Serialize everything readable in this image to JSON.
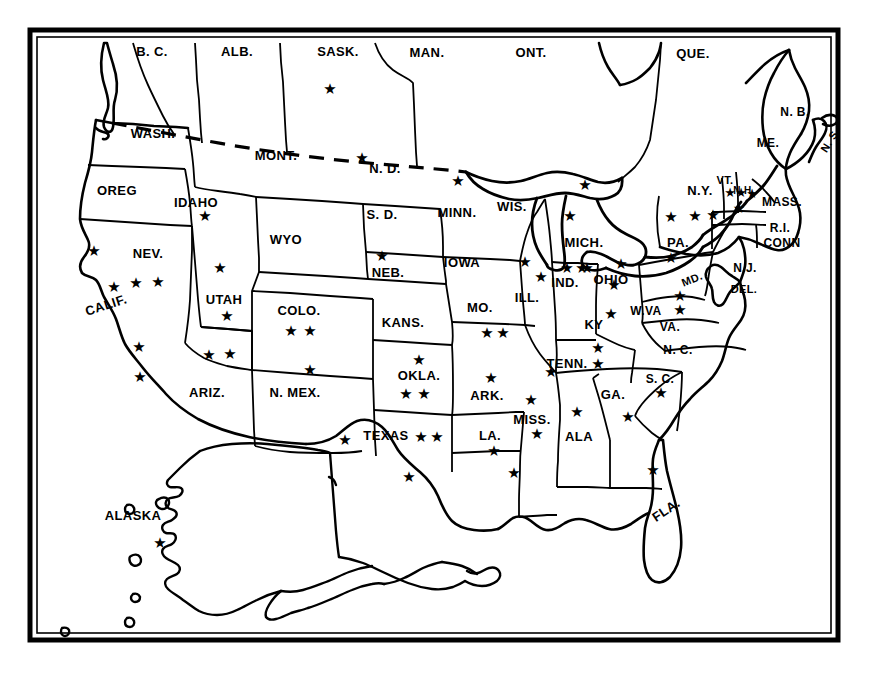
{
  "map": {
    "title": "North America States and Provinces Star Distribution Map",
    "style": {
      "ink_color": "#000000",
      "paper_color": "#ffffff",
      "frame_color": "#000000",
      "star_glyph": "★"
    },
    "frame": {
      "x": 30,
      "y": 30,
      "width": 808,
      "height": 610
    },
    "labels": [
      {
        "name": "label-bc",
        "text": "B. C.",
        "x": 152,
        "y": 51,
        "size": 13
      },
      {
        "name": "label-alb",
        "text": "ALB.",
        "x": 237,
        "y": 51,
        "size": 13
      },
      {
        "name": "label-sask",
        "text": "SASK.",
        "x": 338,
        "y": 51,
        "size": 13
      },
      {
        "name": "label-man",
        "text": "MAN.",
        "x": 427,
        "y": 52,
        "size": 13
      },
      {
        "name": "label-ont",
        "text": "ONT.",
        "x": 531,
        "y": 52,
        "size": 13
      },
      {
        "name": "label-que",
        "text": "QUE.",
        "x": 693,
        "y": 53,
        "size": 13
      },
      {
        "name": "label-nb",
        "text": "N. B.",
        "x": 795,
        "y": 112,
        "size": 12
      },
      {
        "name": "label-ns",
        "text": "N. S.",
        "x": 830,
        "y": 140,
        "size": 11,
        "rotate": -58
      },
      {
        "name": "label-me",
        "text": "ME.",
        "x": 768,
        "y": 143,
        "size": 12
      },
      {
        "name": "label-wash",
        "text": "WASH.",
        "x": 153,
        "y": 133,
        "size": 13
      },
      {
        "name": "label-mont",
        "text": "MONT.",
        "x": 276,
        "y": 155,
        "size": 13
      },
      {
        "name": "label-nd",
        "text": "N. D.",
        "x": 385,
        "y": 168,
        "size": 13
      },
      {
        "name": "label-oreg",
        "text": "OREG",
        "x": 117,
        "y": 190,
        "size": 13
      },
      {
        "name": "label-idaho",
        "text": "IDAHO",
        "x": 196,
        "y": 202,
        "size": 13
      },
      {
        "name": "label-sd",
        "text": "S. D.",
        "x": 382,
        "y": 214,
        "size": 13
      },
      {
        "name": "label-minn",
        "text": "MINN.",
        "x": 457,
        "y": 212,
        "size": 13
      },
      {
        "name": "label-wis",
        "text": "WIS.",
        "x": 512,
        "y": 206,
        "size": 13
      },
      {
        "name": "label-ny",
        "text": "N.Y.",
        "x": 700,
        "y": 190,
        "size": 13
      },
      {
        "name": "label-vt",
        "text": "VT.",
        "x": 725,
        "y": 180,
        "size": 11
      },
      {
        "name": "label-nh",
        "text": "N.H.",
        "x": 744,
        "y": 190,
        "size": 10
      },
      {
        "name": "label-mass",
        "text": "MASS.",
        "x": 782,
        "y": 202,
        "size": 12
      },
      {
        "name": "label-wyo",
        "text": "WYO",
        "x": 286,
        "y": 239,
        "size": 13
      },
      {
        "name": "label-mich",
        "text": "MICH.",
        "x": 584,
        "y": 242,
        "size": 13
      },
      {
        "name": "label-pa",
        "text": "PA.",
        "x": 678,
        "y": 242,
        "size": 13
      },
      {
        "name": "label-ri",
        "text": "R.I.",
        "x": 780,
        "y": 228,
        "size": 12
      },
      {
        "name": "label-conn",
        "text": "CONN",
        "x": 782,
        "y": 243,
        "size": 12
      },
      {
        "name": "label-nev",
        "text": "NEV.",
        "x": 148,
        "y": 253,
        "size": 13
      },
      {
        "name": "label-neb",
        "text": "NEB.",
        "x": 388,
        "y": 272,
        "size": 13
      },
      {
        "name": "label-iowa",
        "text": "IOWA",
        "x": 462,
        "y": 262,
        "size": 13
      },
      {
        "name": "label-ind",
        "text": "IND.",
        "x": 565,
        "y": 282,
        "size": 13
      },
      {
        "name": "label-ohio",
        "text": "OHIO",
        "x": 611,
        "y": 279,
        "size": 13
      },
      {
        "name": "label-nj",
        "text": "N.J.",
        "x": 745,
        "y": 268,
        "size": 12
      },
      {
        "name": "label-md",
        "text": "MD.",
        "x": 692,
        "y": 279,
        "size": 11,
        "rotate": -22
      },
      {
        "name": "label-del",
        "text": "DEL.",
        "x": 744,
        "y": 289,
        "size": 11
      },
      {
        "name": "label-calif",
        "text": "CALIF.",
        "x": 106,
        "y": 305,
        "size": 13,
        "rotate": -18
      },
      {
        "name": "label-utah",
        "text": "UTAH",
        "x": 224,
        "y": 299,
        "size": 13
      },
      {
        "name": "label-colo",
        "text": "COLO.",
        "x": 299,
        "y": 310,
        "size": 13
      },
      {
        "name": "label-ill",
        "text": "ILL.",
        "x": 527,
        "y": 297,
        "size": 13
      },
      {
        "name": "label-mo",
        "text": "MO.",
        "x": 480,
        "y": 307,
        "size": 13
      },
      {
        "name": "label-kans",
        "text": "KANS.",
        "x": 403,
        "y": 322,
        "size": 13
      },
      {
        "name": "label-ky",
        "text": "KY",
        "x": 594,
        "y": 324,
        "size": 13
      },
      {
        "name": "label-wva",
        "text": "W.VA",
        "x": 646,
        "y": 311,
        "size": 12
      },
      {
        "name": "label-va",
        "text": "VA.",
        "x": 670,
        "y": 327,
        "size": 12
      },
      {
        "name": "label-nc",
        "text": "N. C.",
        "x": 678,
        "y": 350,
        "size": 12
      },
      {
        "name": "label-ariz",
        "text": "ARIZ.",
        "x": 207,
        "y": 392,
        "size": 13
      },
      {
        "name": "label-nmex",
        "text": "N. MEX.",
        "x": 295,
        "y": 392,
        "size": 13
      },
      {
        "name": "label-okla",
        "text": "OKLA.",
        "x": 419,
        "y": 375,
        "size": 13
      },
      {
        "name": "label-ark",
        "text": "ARK.",
        "x": 487,
        "y": 395,
        "size": 13
      },
      {
        "name": "label-tenn",
        "text": "TENN.",
        "x": 567,
        "y": 363,
        "size": 13
      },
      {
        "name": "label-ga",
        "text": "GA.",
        "x": 613,
        "y": 394,
        "size": 13
      },
      {
        "name": "label-sc",
        "text": "S. C.",
        "x": 660,
        "y": 379,
        "size": 12
      },
      {
        "name": "label-texas",
        "text": "TEXAS",
        "x": 386,
        "y": 435,
        "size": 13
      },
      {
        "name": "label-la",
        "text": "LA.",
        "x": 490,
        "y": 435,
        "size": 13
      },
      {
        "name": "label-miss",
        "text": "MISS.",
        "x": 532,
        "y": 419,
        "size": 13
      },
      {
        "name": "label-ala",
        "text": "ALA",
        "x": 579,
        "y": 436,
        "size": 13
      },
      {
        "name": "label-fla",
        "text": "FLA.",
        "x": 666,
        "y": 510,
        "size": 13,
        "rotate": -34
      },
      {
        "name": "label-alaska",
        "text": "ALASKA",
        "x": 133,
        "y": 515,
        "size": 13
      }
    ],
    "stars": [
      {
        "name": "star-sask",
        "region": "SASK.",
        "x": 330,
        "y": 89,
        "size": 15
      },
      {
        "name": "star-nd",
        "region": "N. D.",
        "x": 362,
        "y": 158,
        "size": 15
      },
      {
        "name": "star-minn",
        "region": "MINN.",
        "x": 458,
        "y": 181,
        "size": 15
      },
      {
        "name": "star-idaho",
        "region": "IDAHO",
        "x": 205,
        "y": 216,
        "size": 15
      },
      {
        "name": "star-upper-mich",
        "region": "MICH.",
        "x": 585,
        "y": 185,
        "size": 15
      },
      {
        "name": "star-ny-1",
        "region": "N.Y.",
        "x": 671,
        "y": 217,
        "size": 15
      },
      {
        "name": "star-ny-2",
        "region": "N.Y.",
        "x": 695,
        "y": 216,
        "size": 15
      },
      {
        "name": "star-ny-3",
        "region": "N.Y.",
        "x": 713,
        "y": 215,
        "size": 15
      },
      {
        "name": "star-vt",
        "region": "VT.",
        "x": 730,
        "y": 192,
        "size": 13
      },
      {
        "name": "star-nh",
        "region": "N.H.",
        "x": 741,
        "y": 192,
        "size": 13
      },
      {
        "name": "star-me",
        "region": "ME.",
        "x": 752,
        "y": 193,
        "size": 13
      },
      {
        "name": "star-mass",
        "region": "MASS.",
        "x": 739,
        "y": 208,
        "size": 14
      },
      {
        "name": "star-calif-1",
        "region": "CALIF.",
        "x": 94,
        "y": 251,
        "size": 15
      },
      {
        "name": "star-nev-1",
        "region": "NEV.",
        "x": 136,
        "y": 283,
        "size": 15
      },
      {
        "name": "star-nev-2",
        "region": "NEV.",
        "x": 158,
        "y": 282,
        "size": 15
      },
      {
        "name": "star-calif-2",
        "region": "CALIF.",
        "x": 114,
        "y": 287,
        "size": 15
      },
      {
        "name": "star-utah-1",
        "region": "UTAH",
        "x": 220,
        "y": 268,
        "size": 15
      },
      {
        "name": "star-utah-2",
        "region": "UTAH",
        "x": 227,
        "y": 316,
        "size": 15
      },
      {
        "name": "star-neb",
        "region": "NEB.",
        "x": 382,
        "y": 256,
        "size": 15
      },
      {
        "name": "star-mich-2",
        "region": "MICH.",
        "x": 570,
        "y": 216,
        "size": 15
      },
      {
        "name": "star-pa-1",
        "region": "PA.",
        "x": 671,
        "y": 258,
        "size": 15
      },
      {
        "name": "star-ind-1",
        "region": "IND.",
        "x": 567,
        "y": 268,
        "size": 15
      },
      {
        "name": "star-ind-2",
        "region": "IND.",
        "x": 582,
        "y": 268,
        "size": 15
      },
      {
        "name": "star-ohio-1",
        "region": "OHIO",
        "x": 621,
        "y": 264,
        "size": 15
      },
      {
        "name": "star-ohio-2",
        "region": "OHIO",
        "x": 614,
        "y": 285,
        "size": 15
      },
      {
        "name": "star-ill-1",
        "region": "ILL.",
        "x": 525,
        "y": 262,
        "size": 15
      },
      {
        "name": "star-ill-2",
        "region": "ILL.",
        "x": 541,
        "y": 277,
        "size": 15
      },
      {
        "name": "star-wis-1",
        "region": "WIS.",
        "x": 587,
        "y": 268,
        "size": 15
      },
      {
        "name": "star-colo-1",
        "region": "COLO.",
        "x": 291,
        "y": 331,
        "size": 15
      },
      {
        "name": "star-colo-2",
        "region": "COLO.",
        "x": 310,
        "y": 331,
        "size": 15
      },
      {
        "name": "star-calif-3",
        "region": "CALIF.",
        "x": 139,
        "y": 347,
        "size": 15
      },
      {
        "name": "star-ariz-1",
        "region": "ARIZ.",
        "x": 209,
        "y": 355,
        "size": 15
      },
      {
        "name": "star-ariz-2",
        "region": "ARIZ.",
        "x": 230,
        "y": 354,
        "size": 15
      },
      {
        "name": "star-nmex",
        "region": "N. MEX.",
        "x": 310,
        "y": 370,
        "size": 15
      },
      {
        "name": "star-mo-1",
        "region": "MO.",
        "x": 487,
        "y": 333,
        "size": 15
      },
      {
        "name": "star-mo-2",
        "region": "MO.",
        "x": 503,
        "y": 333,
        "size": 15
      },
      {
        "name": "star-ky-1",
        "region": "KY",
        "x": 611,
        "y": 314,
        "size": 15
      },
      {
        "name": "star-wva",
        "region": "W.VA",
        "x": 680,
        "y": 296,
        "size": 15
      },
      {
        "name": "star-va",
        "region": "VA.",
        "x": 680,
        "y": 310,
        "size": 15
      },
      {
        "name": "star-calif-4",
        "region": "CALIF.",
        "x": 140,
        "y": 377,
        "size": 15
      },
      {
        "name": "star-okla-1",
        "region": "OKLA.",
        "x": 419,
        "y": 360,
        "size": 15
      },
      {
        "name": "star-okla-2",
        "region": "OKLA.",
        "x": 406,
        "y": 394,
        "size": 15
      },
      {
        "name": "star-okla-3",
        "region": "OKLA.",
        "x": 424,
        "y": 394,
        "size": 15
      },
      {
        "name": "star-ark",
        "region": "ARK.",
        "x": 491,
        "y": 378,
        "size": 15
      },
      {
        "name": "star-tenn-1",
        "region": "TENN.",
        "x": 598,
        "y": 348,
        "size": 15
      },
      {
        "name": "star-tenn-2",
        "region": "TENN.",
        "x": 598,
        "y": 364,
        "size": 15
      },
      {
        "name": "star-tenn-3",
        "region": "TENN.",
        "x": 551,
        "y": 372,
        "size": 15
      },
      {
        "name": "star-sc",
        "region": "S. C.",
        "x": 661,
        "y": 393,
        "size": 15
      },
      {
        "name": "star-ga",
        "region": "GA.",
        "x": 628,
        "y": 417,
        "size": 15
      },
      {
        "name": "star-miss-1",
        "region": "MISS.",
        "x": 531,
        "y": 400,
        "size": 15
      },
      {
        "name": "star-miss-2",
        "region": "MISS.",
        "x": 537,
        "y": 434,
        "size": 15
      },
      {
        "name": "star-ala",
        "region": "ALA",
        "x": 577,
        "y": 412,
        "size": 15
      },
      {
        "name": "star-texas-1",
        "region": "TEXAS",
        "x": 345,
        "y": 440,
        "size": 15
      },
      {
        "name": "star-texas-2",
        "region": "TEXAS",
        "x": 421,
        "y": 437,
        "size": 15
      },
      {
        "name": "star-texas-3",
        "region": "TEXAS",
        "x": 437,
        "y": 437,
        "size": 15
      },
      {
        "name": "star-texas-4",
        "region": "TEXAS",
        "x": 409,
        "y": 477,
        "size": 15
      },
      {
        "name": "star-la-1",
        "region": "LA.",
        "x": 494,
        "y": 451,
        "size": 15
      },
      {
        "name": "star-la-2",
        "region": "LA.",
        "x": 514,
        "y": 473,
        "size": 15
      },
      {
        "name": "star-fla",
        "region": "FLA.",
        "x": 653,
        "y": 470,
        "size": 15
      },
      {
        "name": "star-alaska",
        "region": "ALASKA",
        "x": 160,
        "y": 543,
        "size": 15
      }
    ],
    "star_counts": {
      "SASK.": 1,
      "N. D.": 1,
      "MINN.": 1,
      "IDAHO": 1,
      "MICH.": 2,
      "N.Y.": 3,
      "VT.": 1,
      "N.H.": 1,
      "ME.": 1,
      "MASS.": 1,
      "CALIF.": 4,
      "NEV.": 2,
      "UTAH": 2,
      "NEB.": 1,
      "PA.": 1,
      "IND.": 2,
      "OHIO": 2,
      "ILL.": 2,
      "WIS.": 1,
      "COLO.": 2,
      "ARIZ.": 2,
      "N. MEX.": 1,
      "MO.": 2,
      "KY": 1,
      "W.VA": 1,
      "VA.": 1,
      "OKLA.": 3,
      "ARK.": 1,
      "TENN.": 3,
      "S. C.": 1,
      "GA.": 1,
      "MISS.": 2,
      "ALA": 1,
      "TEXAS": 4,
      "LA.": 2,
      "FLA.": 1,
      "ALASKA": 1
    },
    "total_stars": 61,
    "boundary_note": "dashed line marks the United States - Canada border across the northern plains"
  }
}
